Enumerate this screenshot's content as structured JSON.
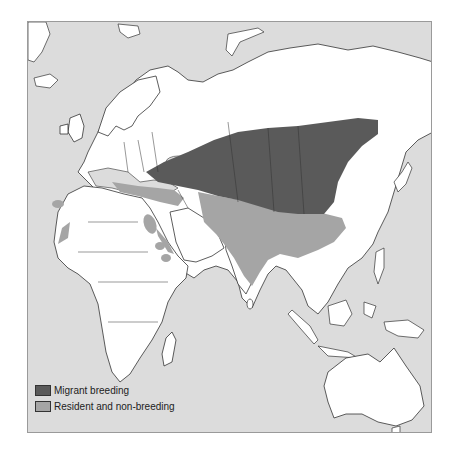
{
  "map": {
    "title": "",
    "colors": {
      "sea": "#dcdcdc",
      "land": "#ffffff",
      "border": "#333333",
      "migrant_breeding": "#5a5a5a",
      "resident_non_breeding": "#a5a5a5"
    },
    "legend": [
      {
        "label": "Migrant breeding",
        "color": "#5a5a5a"
      },
      {
        "label": "Resident and non-breeding",
        "color": "#a5a5a5"
      }
    ],
    "regions_shown": [
      "Europe",
      "Africa",
      "Asia",
      "Australia"
    ]
  }
}
